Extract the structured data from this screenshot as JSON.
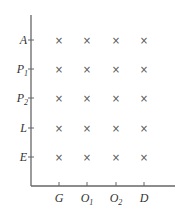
{
  "diagram": {
    "type": "grid-matrix",
    "axis_color": "#666666",
    "mark_symbol": "×",
    "rows": [
      {
        "label": "A",
        "sub": ""
      },
      {
        "label": "P",
        "sub": "1"
      },
      {
        "label": "P",
        "sub": "2"
      },
      {
        "label": "L",
        "sub": ""
      },
      {
        "label": "E",
        "sub": ""
      }
    ],
    "columns": [
      {
        "label": "G",
        "sub": ""
      },
      {
        "label": "O",
        "sub": "1"
      },
      {
        "label": "O",
        "sub": "2"
      },
      {
        "label": "D",
        "sub": ""
      }
    ],
    "cells": [
      [
        "×",
        "×",
        "×",
        "×"
      ],
      [
        "×",
        "×",
        "×",
        "×"
      ],
      [
        "×",
        "×",
        "×",
        "×"
      ],
      [
        "×",
        "×",
        "×",
        "×"
      ],
      [
        "×",
        "×",
        "×",
        "×"
      ]
    ]
  }
}
